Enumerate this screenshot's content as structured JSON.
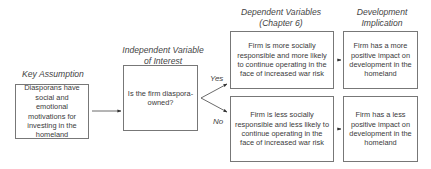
{
  "headers": {
    "key_assumption": "Key Assumption",
    "independent_variable": "Independent Variable of Interest",
    "dependent_variables": "Dependent Variables (Chapter 6)",
    "development_implication": "Development Implication"
  },
  "boxes": {
    "key_assumption": "Diasporans have social and emotional motivations for investing in the homeland",
    "independent_variable": "Is the firm diaspora-owned?",
    "dependent_yes": "Firm is more socially responsible and more likely to continue operating in the face of increased war risk",
    "dependent_no": "Firm is less socially responsible and less likely to continue operating in the face of increased war risk",
    "implication_yes": "Firm has a more positive impact on development in the homeland",
    "implication_no": "Firm has a less positive impact on development in the homeland"
  },
  "branch_labels": {
    "yes": "Yes",
    "no": "No"
  }
}
